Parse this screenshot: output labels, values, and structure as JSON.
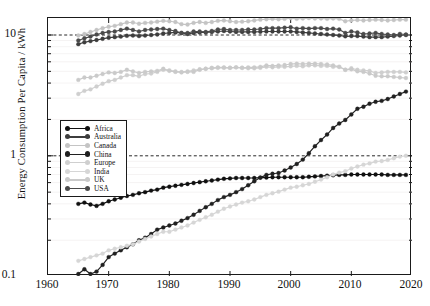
{
  "chart_data": {
    "type": "line",
    "title": "",
    "xlabel": "",
    "ylabel": "Energy Consumption Per Capita / kWh",
    "yscale": "log",
    "xlim": [
      1960,
      2020
    ],
    "ylim": [
      0.1,
      20
    ],
    "xticks": [
      1960,
      1970,
      1980,
      1990,
      2000,
      2010,
      2020
    ],
    "yticks": [
      0.1,
      1,
      10
    ],
    "ytick_labels": [
      "0.1",
      "1",
      "10"
    ],
    "grid": false,
    "reference_lines": [
      {
        "y": 10,
        "style": "dashed"
      },
      {
        "y": 1,
        "style": "dashed"
      }
    ],
    "legend_position": "center-left",
    "marker": "filled-circle",
    "x": [
      1965,
      1966,
      1967,
      1968,
      1969,
      1970,
      1971,
      1972,
      1973,
      1974,
      1975,
      1976,
      1977,
      1978,
      1979,
      1980,
      1981,
      1982,
      1983,
      1984,
      1985,
      1986,
      1987,
      1988,
      1989,
      1990,
      1991,
      1992,
      1993,
      1994,
      1995,
      1996,
      1997,
      1998,
      1999,
      2000,
      2001,
      2002,
      2003,
      2004,
      2005,
      2006,
      2007,
      2008,
      2009,
      2010,
      2011,
      2012,
      2013,
      2014,
      2015,
      2016,
      2017,
      2018,
      2019
    ],
    "series": [
      {
        "name": "Africa",
        "color": "#101010",
        "values": [
          0.4,
          0.41,
          0.395,
          0.385,
          0.4,
          0.42,
          0.435,
          0.45,
          0.465,
          0.475,
          0.49,
          0.5,
          0.515,
          0.525,
          0.545,
          0.555,
          0.565,
          0.575,
          0.585,
          0.595,
          0.605,
          0.615,
          0.625,
          0.635,
          0.645,
          0.65,
          0.655,
          0.655,
          0.655,
          0.655,
          0.66,
          0.66,
          0.665,
          0.665,
          0.665,
          0.665,
          0.665,
          0.665,
          0.67,
          0.675,
          0.68,
          0.685,
          0.69,
          0.695,
          0.695,
          0.7,
          0.7,
          0.7,
          0.7,
          0.7,
          0.7,
          0.695,
          0.695,
          0.695,
          0.695
        ]
      },
      {
        "name": "Australia",
        "color": "#3d3d3d",
        "values": [
          8.4,
          8.7,
          8.9,
          9.1,
          9.3,
          9.5,
          9.6,
          9.7,
          9.85,
          9.9,
          9.8,
          9.9,
          10.0,
          10.1,
          10.3,
          10.4,
          10.5,
          10.4,
          10.2,
          10.4,
          10.5,
          10.5,
          10.6,
          10.7,
          10.8,
          10.7,
          10.6,
          10.6,
          10.6,
          10.6,
          10.65,
          10.7,
          10.7,
          10.7,
          10.7,
          10.7,
          10.6,
          10.5,
          10.4,
          10.3,
          10.2,
          10.1,
          10.0,
          9.9,
          9.75,
          9.8,
          9.8,
          9.7,
          9.6,
          9.6,
          9.6,
          9.7,
          9.8,
          9.9,
          10.0
        ]
      },
      {
        "name": "Canada",
        "color": "#c4c4c4",
        "values": [
          9.9,
          10.2,
          10.6,
          11.0,
          11.4,
          11.7,
          11.9,
          12.3,
          12.7,
          12.7,
          12.4,
          12.6,
          12.7,
          12.9,
          13.1,
          13.0,
          12.8,
          12.3,
          12.2,
          12.6,
          12.8,
          12.6,
          12.8,
          13.1,
          13.2,
          13.0,
          12.8,
          12.9,
          13.0,
          13.2,
          13.4,
          13.5,
          13.6,
          13.5,
          13.6,
          13.8,
          13.6,
          13.7,
          13.8,
          13.7,
          13.7,
          13.6,
          13.7,
          13.6,
          13.0,
          13.2,
          13.3,
          13.2,
          13.3,
          13.4,
          13.3,
          13.2,
          13.3,
          13.4,
          13.4
        ]
      },
      {
        "name": "China",
        "color": "#202020",
        "values": [
          0.105,
          0.115,
          0.105,
          0.11,
          0.125,
          0.145,
          0.155,
          0.165,
          0.175,
          0.185,
          0.2,
          0.21,
          0.225,
          0.245,
          0.255,
          0.265,
          0.275,
          0.29,
          0.305,
          0.325,
          0.35,
          0.375,
          0.4,
          0.43,
          0.455,
          0.475,
          0.5,
          0.53,
          0.57,
          0.615,
          0.66,
          0.695,
          0.71,
          0.72,
          0.755,
          0.8,
          0.855,
          0.93,
          1.05,
          1.2,
          1.35,
          1.5,
          1.7,
          1.85,
          1.98,
          2.2,
          2.45,
          2.55,
          2.7,
          2.8,
          2.85,
          2.95,
          3.1,
          3.25,
          3.4
        ]
      },
      {
        "name": "Europe",
        "color": "#cfcfcf",
        "values": [
          3.25,
          3.45,
          3.55,
          3.75,
          3.95,
          4.15,
          4.25,
          4.45,
          4.65,
          4.65,
          4.55,
          4.75,
          4.8,
          4.95,
          5.15,
          5.1,
          5.0,
          4.95,
          5.0,
          5.1,
          5.2,
          5.25,
          5.35,
          5.4,
          5.4,
          5.35,
          5.4,
          5.35,
          5.3,
          5.3,
          5.35,
          5.45,
          5.4,
          5.45,
          5.45,
          5.5,
          5.55,
          5.5,
          5.6,
          5.6,
          5.55,
          5.55,
          5.45,
          5.45,
          5.15,
          5.3,
          5.15,
          5.1,
          5.05,
          4.85,
          4.9,
          4.95,
          4.95,
          4.95,
          4.9
        ]
      },
      {
        "name": "India",
        "color": "#d6d6d6",
        "values": [
          0.135,
          0.14,
          0.145,
          0.15,
          0.155,
          0.165,
          0.17,
          0.175,
          0.18,
          0.185,
          0.195,
          0.205,
          0.215,
          0.225,
          0.235,
          0.235,
          0.245,
          0.255,
          0.265,
          0.28,
          0.295,
          0.31,
          0.325,
          0.345,
          0.365,
          0.38,
          0.395,
          0.41,
          0.42,
          0.435,
          0.455,
          0.475,
          0.49,
          0.505,
          0.525,
          0.545,
          0.555,
          0.57,
          0.585,
          0.61,
          0.635,
          0.665,
          0.7,
          0.725,
          0.745,
          0.785,
          0.815,
          0.845,
          0.865,
          0.895,
          0.905,
          0.925,
          0.955,
          0.985,
          1.0
        ]
      },
      {
        "name": "UK",
        "color": "#cacaca",
        "values": [
          4.25,
          4.45,
          4.45,
          4.6,
          4.75,
          4.9,
          4.85,
          4.95,
          5.15,
          5.0,
          4.85,
          4.95,
          5.0,
          5.05,
          5.25,
          5.05,
          4.95,
          4.9,
          4.95,
          4.95,
          5.15,
          5.25,
          5.3,
          5.35,
          5.35,
          5.35,
          5.4,
          5.35,
          5.4,
          5.4,
          5.45,
          5.6,
          5.55,
          5.6,
          5.65,
          5.75,
          5.8,
          5.75,
          5.8,
          5.8,
          5.75,
          5.7,
          5.6,
          5.45,
          5.15,
          5.2,
          5.0,
          4.95,
          4.8,
          4.6,
          4.55,
          4.55,
          4.5,
          4.45,
          4.4
        ]
      },
      {
        "name": "USA",
        "color": "#4a4a4a",
        "values": [
          9.0,
          9.4,
          9.7,
          10.1,
          10.4,
          10.6,
          10.7,
          11.0,
          11.3,
          11.0,
          10.7,
          11.0,
          11.1,
          11.2,
          11.3,
          11.0,
          10.8,
          10.4,
          10.4,
          10.7,
          10.7,
          10.6,
          10.8,
          11.1,
          11.2,
          11.0,
          11.0,
          11.0,
          11.1,
          11.1,
          11.2,
          11.4,
          11.4,
          11.4,
          11.5,
          11.6,
          11.3,
          11.4,
          11.3,
          11.4,
          11.4,
          11.2,
          11.3,
          11.1,
          10.4,
          10.7,
          10.5,
          10.2,
          10.3,
          10.4,
          10.2,
          10.1,
          10.0,
          10.2,
          10.1
        ]
      }
    ]
  },
  "legend": {
    "items": [
      {
        "label": "Africa"
      },
      {
        "label": "Australia"
      },
      {
        "label": "Canada"
      },
      {
        "label": "China"
      },
      {
        "label": "Europe"
      },
      {
        "label": "India"
      },
      {
        "label": "UK"
      },
      {
        "label": "USA"
      }
    ]
  }
}
